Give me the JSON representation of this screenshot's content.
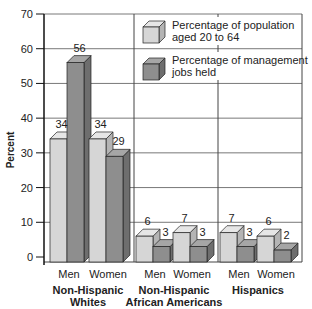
{
  "chart_data": {
    "type": "bar",
    "title": "",
    "xlabel": "",
    "ylabel": "Percent",
    "ylim": [
      0,
      70
    ],
    "yticks": [
      0,
      10,
      20,
      30,
      40,
      50,
      60,
      70
    ],
    "grid": true,
    "legend_position": "top-right, inside plot",
    "groups": [
      {
        "name": "Non-Hispanic Whites",
        "categories": [
          "Men",
          "Women"
        ]
      },
      {
        "name": "Non-Hispanic African Americans",
        "categories": [
          "Men",
          "Women"
        ]
      },
      {
        "name": "Hispanics",
        "categories": [
          "Men",
          "Women"
        ]
      }
    ],
    "categories": [
      "Non-Hispanic Whites Men",
      "Non-Hispanic Whites Women",
      "Non-Hispanic African Americans Men",
      "Non-Hispanic African Americans Women",
      "Hispanics Men",
      "Hispanics Women"
    ],
    "series": [
      {
        "name": "Percentage of population aged 20 to 64",
        "color": "#d4d4d4",
        "values": [
          34,
          34,
          6,
          7,
          7,
          6
        ]
      },
      {
        "name": "Percentage of management jobs held",
        "color": "#8e8e8e",
        "values": [
          56,
          29,
          3,
          3,
          3,
          2
        ]
      }
    ]
  },
  "labels": {
    "ylabel": "Percent",
    "legend": [
      {
        "line1": "Percentage of population",
        "line2": "aged 20 to 64"
      },
      {
        "line1": "Percentage of management",
        "line2": "jobs held"
      }
    ],
    "groups": [
      {
        "line1": "Non-Hispanic",
        "line2": "Whites"
      },
      {
        "line1": "Non-Hispanic",
        "line2": "African Americans"
      },
      {
        "line1": "Hispanics",
        "line2": ""
      }
    ],
    "cat_men": "Men",
    "cat_women": "Women"
  }
}
